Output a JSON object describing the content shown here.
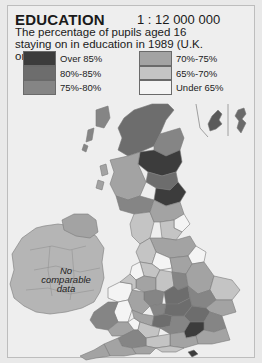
{
  "header": {
    "title": "EDUCATION",
    "scale": "1 : 12 000 000",
    "subtitle": "The percentage of pupils aged 16 staying on in education in 1989 (U.K. only)"
  },
  "legend": {
    "items": [
      {
        "label": "Over 85%",
        "color": "#3c3c3c"
      },
      {
        "label": "80%-85%",
        "color": "#6d6d6d"
      },
      {
        "label": "75%-80%",
        "color": "#858585"
      },
      {
        "label": "70%-75%",
        "color": "#a3a3a3"
      },
      {
        "label": "65%-70%",
        "color": "#c4c4c4"
      },
      {
        "label": "Under 65%",
        "color": "#f4f4f4"
      }
    ]
  },
  "map": {
    "no_data_label": "No comparable data",
    "ireland_color": "#b5b5b5",
    "border_color": "#7a7a7a"
  }
}
